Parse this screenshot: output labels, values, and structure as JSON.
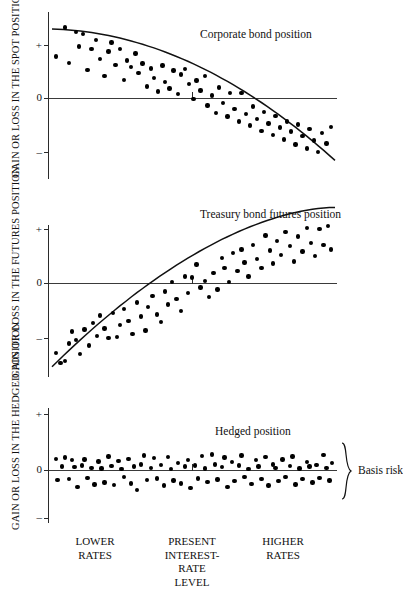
{
  "figure": {
    "x_axis_labels": [
      {
        "text": "LOWER\nRATES",
        "x": 95
      },
      {
        "text": "PRESENT\nINTEREST-\nRATE\nLEVEL",
        "x": 192
      },
      {
        "text": "HIGHER\nRATES",
        "x": 283
      }
    ],
    "annotation": {
      "basis_risk_label": "Basis risk",
      "brace": "}"
    }
  },
  "chart_data": [
    {
      "type": "scatter",
      "title": "Corporate bond position",
      "ylabel": "GAIN OR LOSS IN THE\nSPOT POSITION",
      "xlabel": "",
      "ytick_labels": [
        "+",
        "0",
        "–"
      ],
      "ytick_values": [
        1,
        0,
        -1
      ],
      "ylim": [
        -1.45,
        1.45
      ],
      "xlim": [
        0,
        100
      ],
      "grid": false,
      "legend": "none",
      "trend": {
        "kind": "decreasing-convex",
        "note": "smooth curve falling from upper-left to lower-right"
      },
      "points": [
        [
          1.5,
          0.78
        ],
        [
          4.5,
          1.33
        ],
        [
          6.0,
          0.66
        ],
        [
          8.5,
          1.25
        ],
        [
          9.5,
          0.97
        ],
        [
          11.0,
          1.21
        ],
        [
          12.5,
          0.53
        ],
        [
          14.0,
          0.92
        ],
        [
          15.5,
          1.09
        ],
        [
          17.0,
          0.74
        ],
        [
          18.5,
          0.42
        ],
        [
          20.0,
          0.88
        ],
        [
          21.0,
          1.05
        ],
        [
          22.5,
          0.62
        ],
        [
          24.0,
          0.93
        ],
        [
          25.5,
          0.34
        ],
        [
          26.5,
          0.71
        ],
        [
          28.0,
          0.58
        ],
        [
          29.5,
          0.84
        ],
        [
          30.5,
          0.47
        ],
        [
          32.0,
          0.65
        ],
        [
          33.5,
          0.22
        ],
        [
          35.0,
          0.56
        ],
        [
          36.0,
          0.38
        ],
        [
          37.5,
          0.12
        ],
        [
          39.0,
          0.61
        ],
        [
          40.0,
          0.3
        ],
        [
          41.5,
          0.18
        ],
        [
          43.0,
          0.52
        ],
        [
          44.5,
          0.08
        ],
        [
          45.5,
          0.44
        ],
        [
          47.0,
          0.55
        ],
        [
          48.5,
          0.26
        ],
        [
          50.0,
          -0.02
        ],
        [
          51.0,
          0.33
        ],
        [
          52.5,
          0.14
        ],
        [
          54.0,
          0.41
        ],
        [
          55.0,
          -0.14
        ],
        [
          56.5,
          0.05
        ],
        [
          58.0,
          -0.28
        ],
        [
          59.0,
          0.2
        ],
        [
          60.5,
          -0.09
        ],
        [
          62.0,
          -0.35
        ],
        [
          63.0,
          0.09
        ],
        [
          64.5,
          -0.21
        ],
        [
          66.0,
          -0.44
        ],
        [
          67.0,
          0.1
        ],
        [
          68.5,
          -0.3
        ],
        [
          70.0,
          -0.52
        ],
        [
          71.0,
          -0.16
        ],
        [
          72.5,
          -0.4
        ],
        [
          74.0,
          -0.62
        ],
        [
          75.0,
          -0.26
        ],
        [
          76.5,
          -0.48
        ],
        [
          78.0,
          -0.7
        ],
        [
          79.0,
          -0.34
        ],
        [
          80.5,
          -0.56
        ],
        [
          82.0,
          -0.78
        ],
        [
          83.0,
          -0.44
        ],
        [
          84.5,
          -0.63
        ],
        [
          86.0,
          -0.88
        ],
        [
          87.0,
          -0.5
        ],
        [
          88.5,
          -0.72
        ],
        [
          90.0,
          -0.95
        ],
        [
          91.0,
          -0.58
        ],
        [
          92.5,
          -0.8
        ],
        [
          94.0,
          -1.02
        ],
        [
          95.5,
          -0.66
        ],
        [
          97.0,
          -0.86
        ],
        [
          98.5,
          -0.55
        ]
      ]
    },
    {
      "type": "scatter",
      "title": "Treasury bond futures position",
      "ylabel": "GAIN OR LOSS IN THE\nFUTURES POSITION",
      "xlabel": "",
      "ytick_labels": [
        "+",
        "0",
        "–"
      ],
      "ytick_values": [
        1,
        0,
        -1
      ],
      "ylim": [
        -1.55,
        1.35
      ],
      "xlim": [
        0,
        100
      ],
      "grid": false,
      "legend": "none",
      "trend": {
        "kind": "increasing-concave",
        "note": "smooth curve rising from lower-left, flattening at right"
      },
      "points": [
        [
          1.5,
          -1.3
        ],
        [
          3.0,
          -1.48
        ],
        [
          4.5,
          -1.44
        ],
        [
          6.0,
          -1.12
        ],
        [
          7.0,
          -0.9
        ],
        [
          8.5,
          -1.05
        ],
        [
          10.0,
          -1.32
        ],
        [
          11.5,
          -0.86
        ],
        [
          13.0,
          -1.16
        ],
        [
          14.5,
          -0.74
        ],
        [
          16.0,
          -0.98
        ],
        [
          17.0,
          -0.6
        ],
        [
          18.5,
          -0.84
        ],
        [
          20.0,
          -1.02
        ],
        [
          21.5,
          -0.56
        ],
        [
          23.0,
          -1.0
        ],
        [
          24.0,
          -0.78
        ],
        [
          25.5,
          -0.48
        ],
        [
          27.0,
          -0.7
        ],
        [
          28.5,
          -0.95
        ],
        [
          30.0,
          -0.36
        ],
        [
          31.5,
          -0.62
        ],
        [
          33.0,
          -0.88
        ],
        [
          34.0,
          -0.44
        ],
        [
          35.5,
          -0.24
        ],
        [
          37.0,
          -0.58
        ],
        [
          38.5,
          -0.72
        ],
        [
          40.0,
          -0.16
        ],
        [
          41.0,
          -0.4
        ],
        [
          42.5,
          0.02
        ],
        [
          44.0,
          -0.3
        ],
        [
          45.5,
          -0.52
        ],
        [
          47.0,
          0.12
        ],
        [
          48.0,
          -0.18
        ],
        [
          49.5,
          0.1
        ],
        [
          51.0,
          0.34
        ],
        [
          52.5,
          -0.08
        ],
        [
          54.0,
          0.04
        ],
        [
          55.5,
          -0.26
        ],
        [
          57.0,
          0.18
        ],
        [
          58.5,
          -0.12
        ],
        [
          60.0,
          0.46
        ],
        [
          61.0,
          0.28
        ],
        [
          62.5,
          0.02
        ],
        [
          64.0,
          0.55
        ],
        [
          65.5,
          0.22
        ],
        [
          67.0,
          0.62
        ],
        [
          68.0,
          0.38
        ],
        [
          69.5,
          0.12
        ],
        [
          71.0,
          0.7
        ],
        [
          72.5,
          0.45
        ],
        [
          74.0,
          0.28
        ],
        [
          75.5,
          0.88
        ],
        [
          77.0,
          0.6
        ],
        [
          78.0,
          0.36
        ],
        [
          79.5,
          0.78
        ],
        [
          81.0,
          0.52
        ],
        [
          82.5,
          0.95
        ],
        [
          84.0,
          0.68
        ],
        [
          85.5,
          0.4
        ],
        [
          87.0,
          0.86
        ],
        [
          88.5,
          0.58
        ],
        [
          90.0,
          1.02
        ],
        [
          91.5,
          0.74
        ],
        [
          93.0,
          0.5
        ],
        [
          94.5,
          1.0
        ],
        [
          96.0,
          0.7
        ],
        [
          97.5,
          1.05
        ],
        [
          98.5,
          0.62
        ]
      ]
    },
    {
      "type": "scatter",
      "title": "Hedged position",
      "ylabel": "GAIN OR LOSS IN THE\nHEDGED POSITION",
      "xlabel": "",
      "ytick_labels": [
        "+",
        "0",
        "–"
      ],
      "ytick_values": [
        1,
        0,
        -1
      ],
      "ylim": [
        -1.1,
        1.1
      ],
      "xlim": [
        0,
        100
      ],
      "grid": false,
      "legend": "none",
      "trend": {
        "kind": "flat",
        "note": "no fitted curve; residual scatter band around zero = basis risk"
      },
      "points": [
        [
          1.5,
          0.2
        ],
        [
          2.0,
          -0.18
        ],
        [
          3.5,
          0.06
        ],
        [
          4.5,
          0.22
        ],
        [
          6.0,
          -0.16
        ],
        [
          7.0,
          0.18
        ],
        [
          8.0,
          0.05
        ],
        [
          9.0,
          -0.3
        ],
        [
          10.5,
          0.08
        ],
        [
          11.5,
          0.19
        ],
        [
          12.5,
          -0.14
        ],
        [
          14.0,
          0.04
        ],
        [
          15.0,
          -0.26
        ],
        [
          16.5,
          0.15
        ],
        [
          17.5,
          0.03
        ],
        [
          18.5,
          -0.22
        ],
        [
          20.0,
          0.24
        ],
        [
          21.0,
          0.07
        ],
        [
          22.0,
          -0.27
        ],
        [
          23.5,
          0.16
        ],
        [
          24.5,
          0.02
        ],
        [
          25.5,
          -0.13
        ],
        [
          27.0,
          0.2
        ],
        [
          28.0,
          -0.24
        ],
        [
          29.0,
          0.06
        ],
        [
          30.0,
          -0.36
        ],
        [
          31.5,
          0.1
        ],
        [
          32.5,
          0.26
        ],
        [
          33.5,
          -0.18
        ],
        [
          35.0,
          0.04
        ],
        [
          36.0,
          0.21
        ],
        [
          37.0,
          -0.15
        ],
        [
          38.5,
          0.09
        ],
        [
          39.5,
          -0.28
        ],
        [
          41.0,
          0.23
        ],
        [
          42.0,
          0.02
        ],
        [
          43.0,
          -0.19
        ],
        [
          44.5,
          0.12
        ],
        [
          45.5,
          -0.24
        ],
        [
          47.0,
          0.06
        ],
        [
          48.0,
          0.18
        ],
        [
          49.0,
          -0.32
        ],
        [
          50.5,
          0.08
        ],
        [
          51.5,
          -0.15
        ],
        [
          53.0,
          0.25
        ],
        [
          54.0,
          0.03
        ],
        [
          55.0,
          -0.21
        ],
        [
          56.5,
          0.28
        ],
        [
          57.5,
          0.1
        ],
        [
          58.5,
          -0.17
        ],
        [
          60.0,
          0.05
        ],
        [
          61.0,
          0.22
        ],
        [
          62.0,
          -0.3
        ],
        [
          63.5,
          0.14
        ],
        [
          64.5,
          -0.2
        ],
        [
          66.0,
          0.08
        ],
        [
          67.0,
          0.26
        ],
        [
          68.0,
          -0.13
        ],
        [
          69.5,
          0.02
        ],
        [
          70.5,
          -0.25
        ],
        [
          72.0,
          0.18
        ],
        [
          73.0,
          0.06
        ],
        [
          74.0,
          -0.16
        ],
        [
          75.5,
          0.23
        ],
        [
          76.5,
          -0.28
        ],
        [
          78.0,
          0.1
        ],
        [
          79.0,
          0.04
        ],
        [
          80.0,
          -0.2
        ],
        [
          81.5,
          0.19
        ],
        [
          82.5,
          -0.12
        ],
        [
          84.0,
          0.07
        ],
        [
          85.0,
          0.24
        ],
        [
          86.0,
          -0.26
        ],
        [
          87.5,
          0.03
        ],
        [
          88.5,
          -0.16
        ],
        [
          90.0,
          0.14
        ],
        [
          91.0,
          0.06
        ],
        [
          92.0,
          -0.22
        ],
        [
          93.5,
          0.09
        ],
        [
          94.5,
          -0.14
        ],
        [
          96.0,
          0.27
        ],
        [
          97.0,
          0.04
        ],
        [
          98.0,
          -0.19
        ],
        [
          99.0,
          0.13
        ]
      ]
    }
  ]
}
